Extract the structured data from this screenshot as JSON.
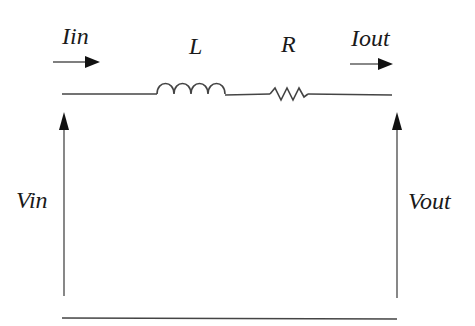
{
  "diagram": {
    "type": "circuit",
    "labels": {
      "input_current": "Iin",
      "output_current": "Iout",
      "inductor": "L",
      "resistor": "R",
      "input_voltage": "Vin",
      "output_voltage": "Vout"
    },
    "components": [
      {
        "id": "L",
        "kind": "inductor",
        "label": "L"
      },
      {
        "id": "R",
        "kind": "resistor",
        "label": "R"
      }
    ],
    "connections": [
      {
        "from": "input_terminal_top",
        "to": "L"
      },
      {
        "from": "L",
        "to": "R"
      },
      {
        "from": "R",
        "to": "output_terminal_top"
      },
      {
        "from": "input_terminal_bottom",
        "to": "output_terminal_bottom"
      }
    ],
    "colors": {
      "wire": "#444444",
      "arrow": "#111111",
      "text": "#1a1a1a",
      "background": "#ffffff"
    }
  }
}
